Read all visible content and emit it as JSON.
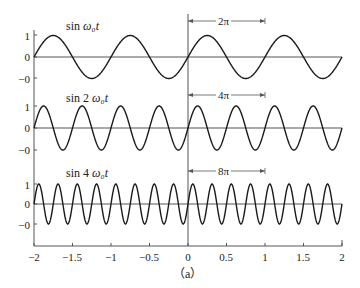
{
  "chart_data": [
    {
      "type": "line",
      "title": "sin ω₀t",
      "title_parts": {
        "prefix": "sin ",
        "var": "ω₀t"
      },
      "function": "sin(2*pi*t)",
      "x_range": [
        -2,
        2
      ],
      "ylim": [
        -1,
        1
      ],
      "yticks": [
        1,
        0,
        -1
      ],
      "ytick_labels": [
        "1",
        "0",
        "−0"
      ],
      "cycles_in_range": 4,
      "annotation": {
        "label": "2π",
        "from_t": 0,
        "to_t": 1
      }
    },
    {
      "type": "line",
      "title": "sin 2 ω₀t",
      "title_parts": {
        "prefix": "sin 2 ",
        "var": "ω₀t"
      },
      "function": "sin(4*pi*t)",
      "x_range": [
        -2,
        2
      ],
      "ylim": [
        -1,
        1
      ],
      "yticks": [
        1,
        0,
        -1
      ],
      "ytick_labels": [
        "1",
        "0",
        "−0"
      ],
      "cycles_in_range": 8,
      "annotation": {
        "label": "4π",
        "from_t": 0,
        "to_t": 1
      }
    },
    {
      "type": "line",
      "title": "sin 4 ω₀t",
      "title_parts": {
        "prefix": "sin 4 ",
        "var": "ω₀t"
      },
      "function": "sin(8*pi*t)",
      "x_range": [
        -2,
        2
      ],
      "ylim": [
        -1,
        1
      ],
      "yticks": [
        1,
        0,
        -1
      ],
      "ytick_labels": [
        "1",
        "0",
        "−0"
      ],
      "cycles_in_range": 16,
      "annotation": {
        "label": "8π",
        "from_t": 0,
        "to_t": 1
      }
    }
  ],
  "x_axis": {
    "ticks": [
      -2,
      -1.5,
      -1,
      -0.5,
      0,
      0.5,
      1,
      1.5,
      2
    ],
    "tick_labels": [
      "−2",
      "−1.5",
      "−1",
      "−0.5",
      "0",
      "0.5",
      "1",
      "1.5",
      "2"
    ]
  },
  "caption": "（a）",
  "colors": {
    "curve": "#1a1a1a",
    "axis": "#555555",
    "text": "#222222"
  }
}
